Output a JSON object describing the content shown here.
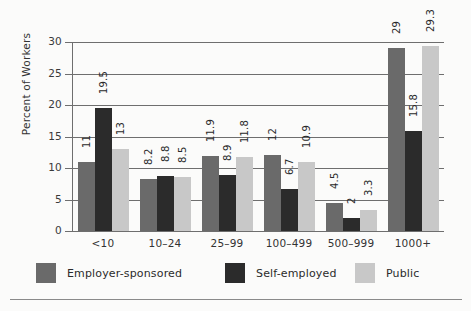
{
  "chart_data": {
    "type": "bar",
    "title": "",
    "xlabel": "",
    "ylabel": "Percent of Workers",
    "ylim": [
      0,
      30
    ],
    "yticks": [
      0,
      5,
      10,
      15,
      20,
      25,
      30
    ],
    "ytick_labels": [
      "0",
      "5",
      "10",
      "15",
      "20",
      "25",
      "30"
    ],
    "grid": true,
    "legend_position": "bottom",
    "categories": [
      "<10",
      "10–24",
      "25–99",
      "100–499",
      "500–999",
      "1000+"
    ],
    "series": [
      {
        "name": "Employer-sponsored",
        "color": "#6a6a6a",
        "values": [
          11,
          8.2,
          11.9,
          12,
          4.5,
          29
        ],
        "value_labels": [
          "11",
          "8.2",
          "11.9",
          "12",
          "4.5",
          "29"
        ]
      },
      {
        "name": "Self-employed",
        "color": "#2b2b2b",
        "values": [
          19.5,
          8.8,
          8.9,
          6.7,
          2,
          15.8
        ],
        "value_labels": [
          "19.5",
          "8.8",
          "8.9",
          "6.7",
          "2",
          "15.8"
        ]
      },
      {
        "name": "Public",
        "color": "#c8c8c8",
        "values": [
          13,
          8.5,
          11.8,
          10.9,
          3.3,
          29.3
        ],
        "value_labels": [
          "13",
          "8.5",
          "11.8",
          "10.9",
          "3.3",
          "29.3"
        ]
      }
    ]
  },
  "legend": {
    "items": [
      {
        "label": "Employer-sponsored",
        "color": "#6a6a6a"
      },
      {
        "label": "Self-employed",
        "color": "#2b2b2b"
      },
      {
        "label": "Public",
        "color": "#c8c8c8"
      }
    ]
  },
  "colors": {
    "employer_sponsored": "#6a6a6a",
    "self_employed": "#2b2b2b",
    "public": "#c8c8c8",
    "axis": "#6e6e6e",
    "background": "#fbfbfa"
  }
}
